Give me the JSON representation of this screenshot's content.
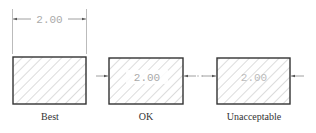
{
  "diagram": {
    "dimension_value": "2.00",
    "panels": [
      {
        "label": "Best",
        "dimension_text": "2.00",
        "placement": "outside-above"
      },
      {
        "label": "OK",
        "dimension_text": "2.00",
        "placement": "inside-with-outside-arrows"
      },
      {
        "label": "Unacceptable",
        "dimension_text": "2.00",
        "placement": "inside-over-hatching"
      }
    ],
    "colors": {
      "line": "#333333",
      "dim_line": "#888888",
      "dim_text": "#aaaaaa",
      "hatch": "#999999"
    }
  }
}
